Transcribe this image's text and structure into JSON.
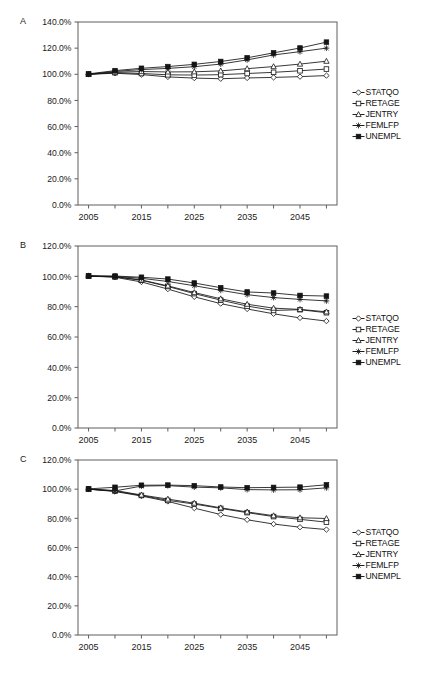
{
  "figure": {
    "panel_labels": [
      "A",
      "B",
      "C"
    ],
    "series_names": [
      "STATQO",
      "RETAGE",
      "JENTRY",
      "FEMLFP",
      "UNEMPL"
    ],
    "marker_icons": [
      "open-diamond-marker-icon",
      "open-square-marker-icon",
      "open-triangle-marker-icon",
      "star-marker-icon",
      "filled-square-marker-icon"
    ],
    "line_color": "#141414",
    "axis_color": "#5e5e5e"
  },
  "panels": [
    {
      "letter": "A",
      "legend": [
        "STATQO",
        "RETAGE",
        "JENTRY",
        "FEMLFP",
        "UNEMPL"
      ],
      "ytick_labels": [
        "0.0%",
        "20.0%",
        "40.0%",
        "60.0%",
        "80.0%",
        "100.0%",
        "120.0%",
        "140.0%"
      ],
      "xtick_labels": [
        "2005",
        "2015",
        "2025",
        "2035",
        "2045"
      ]
    },
    {
      "letter": "B",
      "legend": [
        "STATQO",
        "RETAGE",
        "JENTRY",
        "FEMLFP",
        "UNEMPL"
      ],
      "ytick_labels": [
        "0.0%",
        "20.0%",
        "40.0%",
        "60.0%",
        "80.0%",
        "100.0%",
        "120.0%"
      ],
      "xtick_labels": [
        "2005",
        "2015",
        "2025",
        "2035",
        "2045"
      ]
    },
    {
      "letter": "C",
      "legend": [
        "STATQO",
        "RETAGE",
        "JENTRY",
        "FEMLFP",
        "UNEMPL"
      ],
      "ytick_labels": [
        "0.0%",
        "20.0%",
        "40.0%",
        "60.0%",
        "80.0%",
        "100.0%",
        "120.0%"
      ],
      "xtick_labels": [
        "2005",
        "2015",
        "2025",
        "2035",
        "2045"
      ]
    }
  ],
  "chart_data": [
    {
      "type": "line",
      "panel": "A",
      "title": "",
      "xlabel": "",
      "ylabel": "",
      "x": [
        2005,
        2010,
        2015,
        2020,
        2025,
        2030,
        2035,
        2040,
        2045,
        2050
      ],
      "xlim": [
        2003,
        2052
      ],
      "ylim": [
        0,
        140
      ],
      "ytick_values": [
        0,
        20,
        40,
        60,
        80,
        100,
        120,
        140
      ],
      "xtick_values": [
        2005,
        2015,
        2025,
        2035,
        2045
      ],
      "grid": false,
      "legend_position": "right",
      "series": [
        {
          "name": "STATQO",
          "marker": "open-diamond",
          "values": [
            100.0,
            100.8,
            99.8,
            98.0,
            97.1,
            96.6,
            97.2,
            97.6,
            98.2,
            99.0
          ]
        },
        {
          "name": "RETAGE",
          "marker": "open-square",
          "values": [
            100.0,
            101.2,
            100.6,
            99.6,
            99.4,
            99.7,
            100.6,
            101.5,
            102.7,
            104.0
          ]
        },
        {
          "name": "JENTRY",
          "marker": "open-triangle",
          "values": [
            100.0,
            101.6,
            102.1,
            101.8,
            101.9,
            102.6,
            104.3,
            105.9,
            107.8,
            110.0
          ]
        },
        {
          "name": "FEMLFP",
          "marker": "star",
          "values": [
            100.0,
            102.2,
            103.6,
            104.5,
            105.8,
            107.8,
            111.0,
            114.8,
            117.3,
            120.0
          ]
        },
        {
          "name": "UNEMPL",
          "marker": "filled-square",
          "values": [
            100.3,
            102.8,
            104.6,
            105.9,
            107.6,
            109.8,
            112.6,
            116.4,
            120.1,
            124.6
          ]
        }
      ]
    },
    {
      "type": "line",
      "panel": "B",
      "title": "",
      "xlabel": "",
      "ylabel": "",
      "x": [
        2005,
        2010,
        2015,
        2020,
        2025,
        2030,
        2035,
        2040,
        2045,
        2050
      ],
      "xlim": [
        2003,
        2052
      ],
      "ylim": [
        0,
        120
      ],
      "ytick_values": [
        0,
        20,
        40,
        60,
        80,
        100,
        120
      ],
      "xtick_values": [
        2005,
        2015,
        2025,
        2035,
        2045
      ],
      "grid": false,
      "legend_position": "right",
      "series": [
        {
          "name": "STATQO",
          "marker": "open-diamond",
          "values": [
            100.2,
            99.4,
            96.3,
            91.6,
            86.5,
            82.0,
            78.5,
            75.3,
            72.6,
            70.5
          ]
        },
        {
          "name": "RETAGE",
          "marker": "open-square",
          "values": [
            100.2,
            99.6,
            97.4,
            93.3,
            88.6,
            84.3,
            80.4,
            77.5,
            78.0,
            76.0
          ]
        },
        {
          "name": "JENTRY",
          "marker": "open-triangle",
          "values": [
            100.2,
            99.8,
            97.6,
            93.7,
            89.3,
            85.2,
            81.6,
            79.0,
            78.2,
            76.6
          ]
        },
        {
          "name": "FEMLFP",
          "marker": "star",
          "values": [
            100.2,
            99.9,
            98.7,
            96.6,
            93.8,
            90.8,
            87.9,
            86.0,
            84.8,
            83.8
          ]
        },
        {
          "name": "UNEMPL",
          "marker": "filled-square",
          "values": [
            100.3,
            100.2,
            99.4,
            98.2,
            95.6,
            92.5,
            89.7,
            89.0,
            87.4,
            87.0
          ]
        }
      ]
    },
    {
      "type": "line",
      "panel": "C",
      "title": "",
      "xlabel": "",
      "ylabel": "",
      "x": [
        2005,
        2010,
        2015,
        2020,
        2025,
        2030,
        2035,
        2040,
        2045,
        2050
      ],
      "xlim": [
        2003,
        2052
      ],
      "ylim": [
        0,
        120
      ],
      "ytick_values": [
        0,
        20,
        40,
        60,
        80,
        100,
        120
      ],
      "xtick_values": [
        2005,
        2015,
        2025,
        2035,
        2045
      ],
      "grid": false,
      "legend_position": "right",
      "series": [
        {
          "name": "STATQO",
          "marker": "open-diamond",
          "values": [
            100.0,
            98.4,
            95.3,
            91.6,
            87.0,
            82.6,
            79.0,
            76.1,
            73.9,
            72.3
          ]
        },
        {
          "name": "RETAGE",
          "marker": "open-square",
          "values": [
            100.0,
            98.7,
            95.7,
            92.3,
            89.8,
            86.8,
            83.9,
            81.2,
            79.3,
            77.4
          ]
        },
        {
          "name": "JENTRY",
          "marker": "open-triangle",
          "values": [
            100.0,
            99.1,
            96.0,
            93.2,
            90.4,
            87.2,
            84.4,
            81.8,
            80.4,
            79.9
          ]
        },
        {
          "name": "FEMLFP",
          "marker": "star",
          "values": [
            100.0,
            98.8,
            102.1,
            102.4,
            101.4,
            100.9,
            99.7,
            99.5,
            99.6,
            100.9
          ]
        },
        {
          "name": "UNEMPL",
          "marker": "filled-square",
          "values": [
            100.2,
            101.3,
            102.7,
            102.8,
            102.4,
            101.5,
            101.0,
            101.2,
            101.4,
            103.0
          ]
        }
      ]
    }
  ]
}
